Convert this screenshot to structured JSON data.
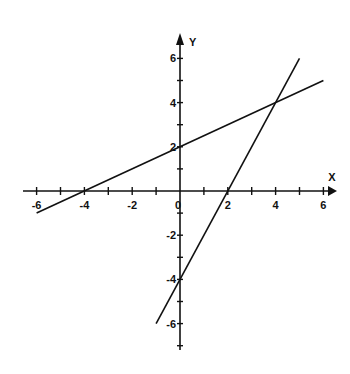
{
  "chart_data": {
    "type": "line",
    "title": "",
    "xlabel": "X",
    "ylabel": "Y",
    "xlim": [
      -6.5,
      6.5
    ],
    "ylim": [
      -7,
      6.8
    ],
    "grid": false,
    "x_ticks": [
      -6,
      -5,
      -4,
      -3,
      -2,
      -1,
      0,
      1,
      2,
      3,
      4,
      5,
      6
    ],
    "y_ticks": [
      -7,
      -6,
      -5,
      -4,
      -3,
      -2,
      -1,
      0,
      1,
      2,
      3,
      4,
      5,
      6
    ],
    "x_tick_labels": [
      "-6",
      "-4",
      "-2",
      "0",
      "2",
      "4",
      "6"
    ],
    "y_tick_labels": [
      "6",
      "4",
      "2",
      "-2",
      "-4",
      "-6"
    ],
    "origin_label": "0",
    "series": [
      {
        "name": "y = 0.5x + 2",
        "x": [
          -6,
          6
        ],
        "y": [
          -1,
          5
        ]
      },
      {
        "name": "y = 2x - 4",
        "x": [
          -1,
          5
        ],
        "y": [
          -6,
          6
        ]
      }
    ],
    "intersections": [
      {
        "x": 4,
        "y": 4
      },
      {
        "x": -4,
        "y": 0
      },
      {
        "x": 2,
        "y": 0
      },
      {
        "x": 0,
        "y": 2
      },
      {
        "x": 0,
        "y": -4
      }
    ],
    "colors": {
      "axis": "#111111",
      "line": "#111111",
      "background": "#ffffff"
    }
  }
}
